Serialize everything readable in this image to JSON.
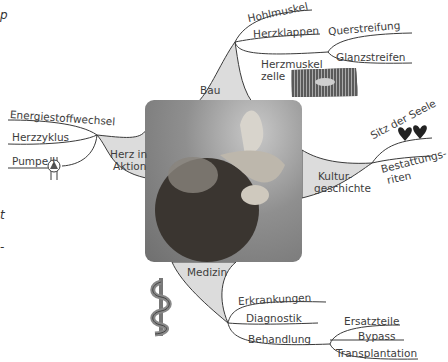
{
  "center": {
    "image": "anatomical-heart-photo"
  },
  "branches": {
    "bau": {
      "label": "Bau",
      "children": [
        "Hohlmuskel",
        "Herzklappen",
        "Herzmuskel\nzelle"
      ],
      "sub": {
        "herzklappen": [
          "Querstreifung",
          "Glanzstreifen"
        ]
      },
      "herzmuskel_line1": "Herzmuskel",
      "herzmuskel_line2": "zelle"
    },
    "herz_in_aktion": {
      "label_line1": "Herz in",
      "label_line2": "Aktion",
      "children": [
        "Energiestoffwechsel",
        "Herzzyklus",
        "Pumpe !"
      ]
    },
    "kulturgeschichte": {
      "label_line1": "Kultur-",
      "label_line2": "geschichte",
      "children": [
        "Sitz der Seele",
        "Bestattungs-\nriten"
      ],
      "bestattung_line1": "Bestattungs-",
      "bestattung_line2": "riten"
    },
    "medizin": {
      "label": "Medizin",
      "children": [
        "Erkrankungen",
        "Diagnostik",
        "Behandlung"
      ],
      "behandlung_sub": [
        "Ersatzteile",
        "Bypass",
        "Transplantation"
      ]
    }
  },
  "edge_fragments": [
    "p",
    "t",
    "-"
  ],
  "colors": {
    "branch_fill": "#dcdcdc",
    "line": "#3a3a3a",
    "text": "#3c3c3c"
  }
}
